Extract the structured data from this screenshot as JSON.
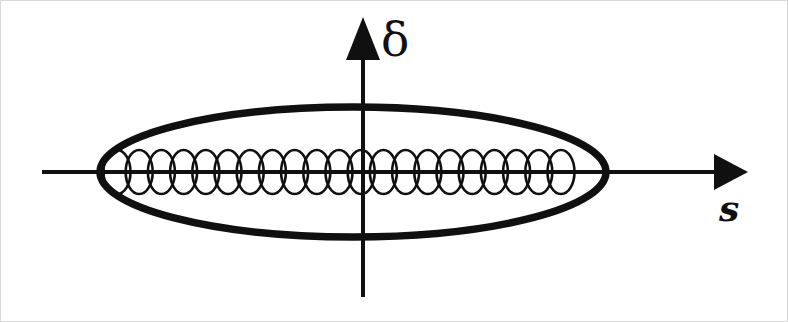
{
  "figure": {
    "background_color": "#ffffff",
    "frame_color": "#d9d9d9",
    "width": 788,
    "height": 322,
    "stroke_color": "#101010"
  },
  "axes": {
    "vertical": {
      "label": "δ",
      "label_name": "delta",
      "x": 363,
      "y_top": 17,
      "y_bottom": 297,
      "line_width": 4,
      "arrow": {
        "position": "top",
        "half_width": 17,
        "length": 44
      }
    },
    "horizontal": {
      "label": "s",
      "label_name": "s",
      "y": 172,
      "x_left": 42,
      "x_right": 748,
      "line_width": 4,
      "arrow": {
        "position": "right",
        "half_width": 18,
        "length": 34
      }
    },
    "origin": {
      "x": 363,
      "y": 172
    }
  },
  "chart_data": {
    "type": "scatter",
    "title": "",
    "xlabel": "s",
    "ylabel": "δ",
    "grid": false,
    "legend": null,
    "annotations": [],
    "shapes": [
      {
        "name": "rf-bucket-separatrix",
        "kind": "ellipse",
        "cx": 353,
        "cy": 172,
        "rx": 253,
        "ry": 65,
        "stroke_width": 7.5,
        "fill": "none",
        "stroke": "#101010"
      },
      {
        "name": "microbunch-chain",
        "kind": "ellipse-chain",
        "count": 21,
        "cy": 172,
        "rx": 13.5,
        "ry": 22,
        "x_start": 117,
        "spacing": 22.2,
        "stroke_width": 2.6,
        "fill": "none",
        "stroke": "#101010"
      }
    ]
  }
}
